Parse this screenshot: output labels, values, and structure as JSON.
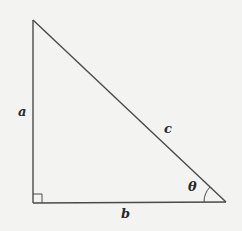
{
  "diagram": {
    "type": "right-triangle",
    "colors": {
      "background": "#f3f3f2",
      "stroke": "#4a4a4a",
      "text": "#2a2a2a"
    },
    "vertices": {
      "top": [
        33,
        20
      ],
      "right_angle": [
        33,
        203
      ],
      "angle_theta": [
        226,
        202
      ]
    },
    "labels": {
      "side_a": "a",
      "side_b": "b",
      "side_c": "c",
      "angle": "θ"
    },
    "markers": {
      "right_angle_square": true,
      "angle_arc": true
    }
  }
}
